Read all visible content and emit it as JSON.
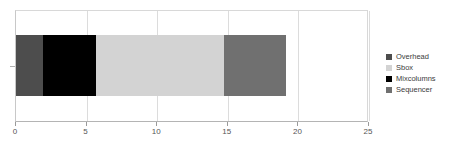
{
  "chart_data": {
    "type": "bar",
    "orientation": "horizontal",
    "stacked": true,
    "title": "",
    "xlabel": "",
    "ylabel": "",
    "categories": [
      ""
    ],
    "xlim": [
      0,
      25
    ],
    "xticks": [
      0,
      5,
      10,
      15,
      20,
      25
    ],
    "xtick_labels": [
      "0",
      "5",
      "10",
      "15",
      "20",
      "25"
    ],
    "grid": true,
    "grid_axis": "x",
    "legend_position": "right",
    "total": 19.1,
    "series": [
      {
        "name": "Overhead",
        "values": [
          1.9
        ],
        "color": "#4d4d4d",
        "start": 0,
        "end": 1.9
      },
      {
        "name": "Sbox",
        "values": [
          9.0
        ],
        "color": "#d3d3d3",
        "start": 5.7,
        "end": 14.7
      },
      {
        "name": "Mixcolumns",
        "values": [
          3.8
        ],
        "color": "#000000",
        "start": 1.9,
        "end": 5.7
      },
      {
        "name": "Sequencer",
        "values": [
          4.4
        ],
        "color": "#707070",
        "start": 14.7,
        "end": 19.1
      }
    ],
    "segment_draw_order": [
      "Overhead",
      "Mixcolumns",
      "Sbox",
      "Sequencer"
    ]
  },
  "legend": {
    "items": [
      {
        "label": "Overhead",
        "color": "#4d4d4d"
      },
      {
        "label": "Sbox",
        "color": "#d3d3d3"
      },
      {
        "label": "Mixcolumns",
        "color": "#000000"
      },
      {
        "label": "Sequencer",
        "color": "#707070"
      }
    ]
  },
  "axis": {
    "ticks": [
      {
        "label": "0",
        "value": 0
      },
      {
        "label": "5",
        "value": 5
      },
      {
        "label": "10",
        "value": 10
      },
      {
        "label": "15",
        "value": 15
      },
      {
        "label": "20",
        "value": 20
      },
      {
        "label": "25",
        "value": 25
      }
    ]
  },
  "colors": {
    "plot_background": "#ffffff",
    "gridline": "#dcdcdc",
    "axis_line": "#b4b4b4",
    "tick_text": "#555555",
    "legend_text": "#3c3c3c"
  }
}
